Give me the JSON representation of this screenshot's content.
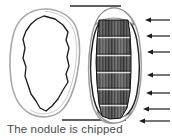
{
  "figure": {
    "caption": "The nodule is chipped",
    "colors": {
      "background": "#ffffff",
      "outer_contour": "#a8a8a8",
      "inner_contour": "#1a1a1a",
      "flake_scar_dark": "#3a3a3a",
      "flake_scar_mid": "#6e6e6e",
      "flake_scar_light": "#b9b9b9",
      "guide_line": "#2a2a2a",
      "arrow": "#1a1a1a",
      "caption_text": "#4a4a4a"
    },
    "views": [
      {
        "name": "plan-view",
        "label": "nodule plan view",
        "description": "Outline of an unworked flint nodule seen from above, drawn with a soft grey outer cortex contour and an angular black inner contour."
      },
      {
        "name": "profile-view",
        "label": "nodule profile view",
        "description": "The same nodule seen in profile after chipping, showing a column of dark flake scars down the centre."
      }
    ],
    "guide_lines": [
      {
        "name": "top-correlation-line",
        "x1": 70,
        "x2": 121,
        "y": 6
      },
      {
        "name": "bottom-correlation-line",
        "x1": 62,
        "x2": 126,
        "y": 120
      }
    ],
    "arrows": {
      "count": 7,
      "direction": "left",
      "meaning": "direction of percussion blows struck against the nodule edge",
      "items": [
        {
          "index": 1,
          "y": 20,
          "tail_x": 170,
          "head_x": 146
        },
        {
          "index": 2,
          "y": 36,
          "tail_x": 170,
          "head_x": 147
        },
        {
          "index": 3,
          "y": 52,
          "tail_x": 170,
          "head_x": 148
        },
        {
          "index": 4,
          "y": 75,
          "tail_x": 170,
          "head_x": 148
        },
        {
          "index": 5,
          "y": 93,
          "tail_x": 170,
          "head_x": 147
        },
        {
          "index": 6,
          "y": 109,
          "tail_x": 170,
          "head_x": 144
        },
        {
          "index": 7,
          "y": 121,
          "tail_x": 170,
          "head_x": 140
        }
      ]
    },
    "flake_scars": {
      "count": 6,
      "band_top": 20,
      "band_bottom": 118,
      "description": "Six stacked flake removal scars with vertical striations"
    }
  }
}
